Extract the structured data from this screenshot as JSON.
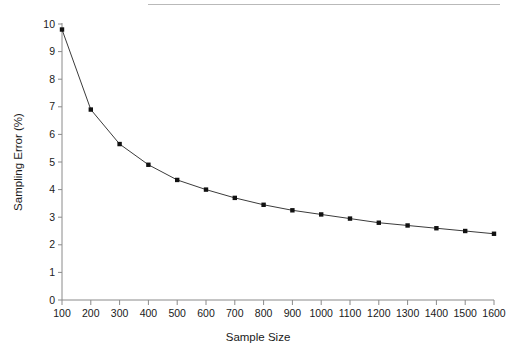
{
  "figure": {
    "top_rule_color": "#b9b9b9",
    "background": "#ffffff"
  },
  "chart_data": {
    "type": "line",
    "title": "",
    "subtitle": "",
    "xlabel": "Sample Size",
    "ylabel": "Sampling Error (%)",
    "x": [
      100,
      200,
      300,
      400,
      500,
      600,
      700,
      800,
      900,
      1000,
      1100,
      1200,
      1300,
      1400,
      1500,
      1600
    ],
    "values": [
      9.8,
      6.9,
      5.65,
      4.9,
      4.35,
      4.0,
      3.7,
      3.45,
      3.25,
      3.1,
      2.95,
      2.8,
      2.7,
      2.6,
      2.5,
      2.4
    ],
    "series": [
      {
        "name": "Sampling Error",
        "values": [
          9.8,
          6.9,
          5.65,
          4.9,
          4.35,
          4.0,
          3.7,
          3.45,
          3.25,
          3.1,
          2.95,
          2.8,
          2.7,
          2.6,
          2.5,
          2.4
        ],
        "line_color": "#3b3b3b",
        "marker": "square",
        "marker_color": "#111111"
      }
    ],
    "xlim": [
      100,
      1600
    ],
    "ylim": [
      0,
      10
    ],
    "xticks": [
      100,
      200,
      300,
      400,
      500,
      600,
      700,
      800,
      900,
      1000,
      1100,
      1200,
      1300,
      1400,
      1500,
      1600
    ],
    "xtick_labels": [
      "100",
      "200",
      "300",
      "400",
      "500",
      "600",
      "700",
      "800",
      "900",
      "1000",
      "1100",
      "1200",
      "1300",
      "1400",
      "1500",
      "1600"
    ],
    "yticks": [
      0,
      1,
      2,
      3,
      4,
      5,
      6,
      7,
      8,
      9,
      10
    ],
    "ytick_labels": [
      "0",
      "1",
      "2",
      "3",
      "4",
      "5",
      "6",
      "7",
      "8",
      "9",
      "10"
    ],
    "grid": false,
    "legend": false,
    "legend_position": "none",
    "axis_color": "#8a8a8a"
  }
}
